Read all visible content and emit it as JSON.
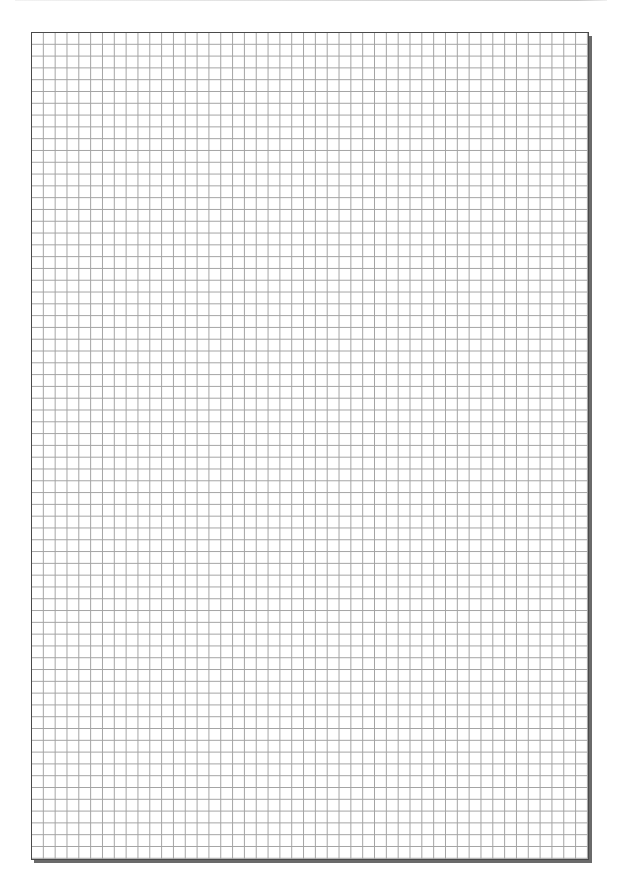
{
  "page": {
    "type": "graph-paper",
    "title": "",
    "background_color": "#ffffff"
  },
  "grid": {
    "columns": 47,
    "rows": 70,
    "cell_width_px": 11.83,
    "cell_height_px": 11.8,
    "line_color": "#a3a3a3",
    "border_color": "#4a4a4a",
    "shadow_color": "#6a6a6a",
    "left_px": 31,
    "top_px": 32,
    "width_px": 558,
    "height_px": 828
  }
}
